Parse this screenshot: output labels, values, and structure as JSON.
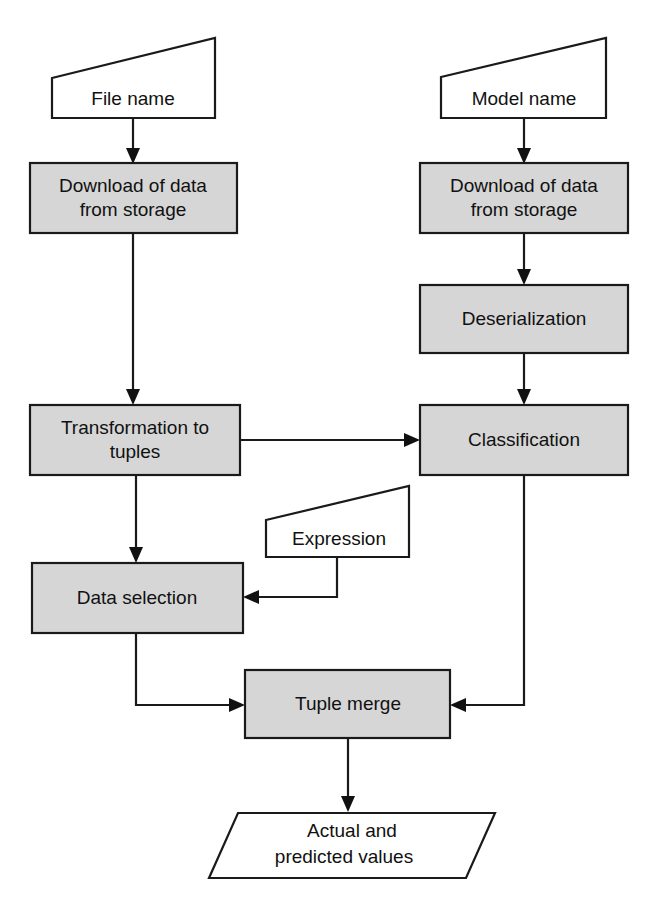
{
  "diagram": {
    "colors": {
      "process_fill": "#d6d6d6",
      "io_fill": "#ffffff",
      "stroke": "#1a1a1a",
      "text": "#111111",
      "background": "#ffffff"
    },
    "nodes": [
      {
        "id": "file-name",
        "type": "manual-input",
        "label": "File name",
        "label_lines": [
          "File name"
        ]
      },
      {
        "id": "download-of-data-from-storage-left",
        "type": "process",
        "label": "Download of data from storage",
        "label_lines": [
          "Download of data",
          "from storage"
        ]
      },
      {
        "id": "transformation-to-tuples",
        "type": "process",
        "label": "Transformation to tuples",
        "label_lines": [
          "Transformation to",
          "tuples"
        ]
      },
      {
        "id": "data-selection",
        "type": "process",
        "label": "Data selection",
        "label_lines": [
          "Data selection"
        ]
      },
      {
        "id": "model-name",
        "type": "manual-input",
        "label": "Model name",
        "label_lines": [
          "Model name"
        ]
      },
      {
        "id": "download-of-data-from-storage-right",
        "type": "process",
        "label": "Download of data from storage",
        "label_lines": [
          "Download of data",
          "from storage"
        ]
      },
      {
        "id": "deserialization",
        "type": "process",
        "label": "Deserialization",
        "label_lines": [
          "Deserialization"
        ]
      },
      {
        "id": "classification",
        "type": "process",
        "label": "Classification",
        "label_lines": [
          "Classification"
        ]
      },
      {
        "id": "expression",
        "type": "manual-input",
        "label": "Expression",
        "label_lines": [
          "Expression"
        ]
      },
      {
        "id": "tuple-merge",
        "type": "process",
        "label": "Tuple merge",
        "label_lines": [
          "Tuple merge"
        ]
      },
      {
        "id": "actual-and-predicted-values",
        "type": "data-parallelogram",
        "label": "Actual and predicted values",
        "label_lines": [
          "Actual and",
          "predicted values"
        ]
      }
    ],
    "edges": [
      {
        "id": "edge-file-name-to-download-left",
        "from": "file-name",
        "to": "download-of-data-from-storage-left"
      },
      {
        "id": "edge-download-left-to-transformation",
        "from": "download-of-data-from-storage-left",
        "to": "transformation-to-tuples"
      },
      {
        "id": "edge-transformation-to-data-selection",
        "from": "transformation-to-tuples",
        "to": "data-selection"
      },
      {
        "id": "edge-transformation-to-classification",
        "from": "transformation-to-tuples",
        "to": "classification"
      },
      {
        "id": "edge-model-name-to-download-right",
        "from": "model-name",
        "to": "download-of-data-from-storage-right"
      },
      {
        "id": "edge-download-right-to-deserialization",
        "from": "download-of-data-from-storage-right",
        "to": "deserialization"
      },
      {
        "id": "edge-deserialization-to-classification",
        "from": "deserialization",
        "to": "classification"
      },
      {
        "id": "edge-expression-to-data-selection",
        "from": "expression",
        "to": "data-selection"
      },
      {
        "id": "edge-data-selection-to-tuple-merge",
        "from": "data-selection",
        "to": "tuple-merge"
      },
      {
        "id": "edge-classification-to-tuple-merge",
        "from": "classification",
        "to": "tuple-merge"
      },
      {
        "id": "edge-tuple-merge-to-output",
        "from": "tuple-merge",
        "to": "actual-and-predicted-values"
      }
    ]
  }
}
